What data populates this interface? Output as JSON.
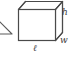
{
  "figure": {
    "type": "geometry-diagram",
    "background_color": "#ffffff",
    "stroke_color": "#4a4a4a",
    "face_fill": "#ffffff",
    "labels": {
      "height": "h",
      "width": "w",
      "length": "ℓ"
    },
    "label_names": {
      "height": "height-label",
      "width": "width-label",
      "length": "length-label"
    },
    "partial_shape": {
      "name": "partial-triangle-wedge",
      "description": "clipped triangle tip at left edge",
      "stroke_color": "#5a5a5a"
    }
  }
}
